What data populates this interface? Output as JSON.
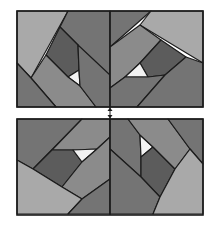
{
  "figure": {
    "colors": {
      "light": "#a9a9a9",
      "medium": "#8b8b8b",
      "mid_dark": "#747474",
      "dark": "#5c5c5c",
      "white": "#f2f2f2",
      "stroke": "#1c1c1c"
    },
    "panels": [
      {
        "name": "top-panel",
        "position": "top",
        "x": 17,
        "y": 11,
        "width": 186,
        "height": 96
      },
      {
        "name": "bottom-panel",
        "position": "bottom",
        "x": 17,
        "y": 119,
        "width": 186,
        "height": 96
      }
    ],
    "connector": {
      "icon": "double-arrow-vertical",
      "x": 110
    }
  }
}
